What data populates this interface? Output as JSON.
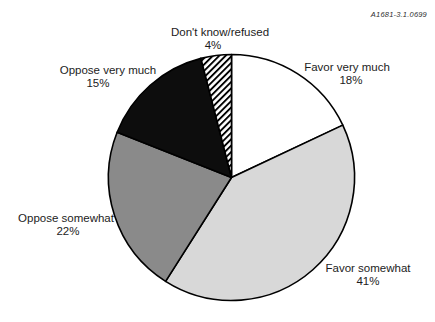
{
  "watermark": "A1681-3.1.0699",
  "chart_data": {
    "type": "pie",
    "title": "",
    "categories": [
      "Favor very much",
      "Favor somewhat",
      "Oppose somewhat",
      "Oppose very much",
      "Don't know/refused"
    ],
    "values": [
      18,
      41,
      22,
      15,
      4
    ],
    "unit": "%",
    "start_angle_deg": 0,
    "direction": "clockwise",
    "legend_position": "none",
    "grid": false,
    "stroke_color": "#000000",
    "slice_fills": [
      "#ffffff",
      "#d8d8d8",
      "#8a8a8a",
      "#0d0d0d",
      "diagonal-hatch"
    ],
    "labels": [
      {
        "name": "Favor very much",
        "value_label": "18%"
      },
      {
        "name": "Favor somewhat",
        "value_label": "41%"
      },
      {
        "name": "Oppose somewhat",
        "value_label": "22%"
      },
      {
        "name": "Oppose very much",
        "value_label": "15%"
      },
      {
        "name": "Don't know/refused",
        "value_label": "4%"
      }
    ]
  }
}
